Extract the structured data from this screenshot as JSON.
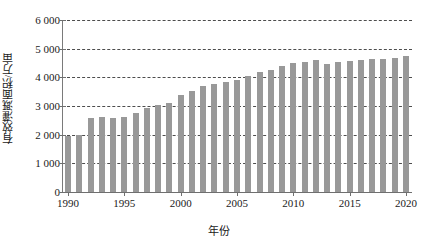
{
  "chart_data": {
    "type": "bar",
    "title": "",
    "xlabel": "年份",
    "ylabel": "有效灌溉面积/万亩",
    "categories": [
      1990,
      1991,
      1992,
      1993,
      1994,
      1995,
      1996,
      1997,
      1998,
      1999,
      2000,
      2001,
      2002,
      2003,
      2004,
      2005,
      2006,
      2007,
      2008,
      2009,
      2010,
      2011,
      2012,
      2013,
      2014,
      2015,
      2016,
      2017,
      2018,
      2019,
      2020
    ],
    "values": [
      1970,
      2000,
      2580,
      2600,
      2590,
      2620,
      2750,
      2930,
      3050,
      3090,
      3370,
      3530,
      3690,
      3780,
      3850,
      3900,
      4050,
      4170,
      4260,
      4380,
      4500,
      4550,
      4600,
      4450,
      4520,
      4560,
      4600,
      4630,
      4650,
      4680,
      4740
    ],
    "series": [
      {
        "name": "有效灌溉面积",
        "values": [
          1970,
          2000,
          2580,
          2600,
          2590,
          2620,
          2750,
          2930,
          3050,
          3090,
          3370,
          3530,
          3690,
          3780,
          3850,
          3900,
          4050,
          4170,
          4260,
          4380,
          4500,
          4550,
          4600,
          4450,
          4520,
          4560,
          4600,
          4630,
          4650,
          4680,
          4740
        ]
      }
    ],
    "ylim": [
      0,
      6000
    ],
    "xlim": [
      1990,
      2020
    ],
    "y_ticks": [
      0,
      1000,
      2000,
      3000,
      4000,
      5000,
      6000
    ],
    "y_tick_labels": [
      "0",
      "1 000",
      "2 000",
      "3 000",
      "4 000",
      "5 000",
      "6 000"
    ],
    "x_ticks": [
      1990,
      1995,
      2000,
      2005,
      2010,
      2015,
      2020
    ],
    "x_tick_labels": [
      "1990",
      "1995",
      "2000",
      "2005",
      "2010",
      "2015",
      "2020"
    ],
    "grid": "horizontal-dashed",
    "legend": "none",
    "bar_color": "#999999",
    "grid_color": "#4d4d4d",
    "axis_color": "#6f6f6f",
    "text_color": "#1a1a1a"
  }
}
